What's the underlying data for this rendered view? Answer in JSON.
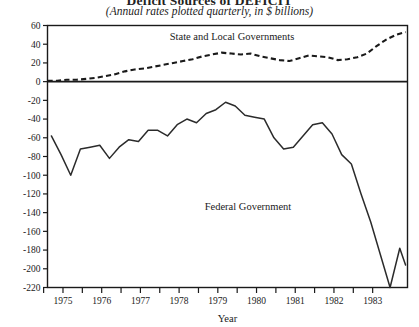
{
  "title": {
    "main": "Deficit Sources of DEFICIT",
    "sub": "(Annual rates plotted quarterly, in $ billions)"
  },
  "axes": {
    "x_title": "Year",
    "y_title": ""
  },
  "labels": {
    "state_local": "State and Local Governments",
    "federal": "Federal Government"
  },
  "chart_data": {
    "type": "line",
    "title": "Deficit Sources of DEFICIT",
    "subtitle": "(Annual rates plotted quarterly, in $ billions)",
    "xlabel": "Year",
    "ylabel": "",
    "xlim": [
      1974.6,
      1983.9
    ],
    "ylim": [
      -220,
      60
    ],
    "yticks": [
      60,
      40,
      20,
      0,
      -20,
      -40,
      -60,
      -80,
      -100,
      -120,
      -140,
      -160,
      -180,
      -200,
      -220
    ],
    "ytick_labels": [
      "60",
      "40",
      "20",
      "0",
      "-20",
      "-40",
      "-60",
      "-80",
      "-100",
      "-120",
      "-140",
      "-160",
      "-180",
      "-200",
      "-220"
    ],
    "xticks": [
      1975,
      1976,
      1977,
      1978,
      1979,
      1980,
      1981,
      1982,
      1983
    ],
    "xtick_labels": [
      "1975",
      "1976",
      "1977",
      "1978",
      "1979",
      "1980",
      "1981",
      "1982",
      "1983"
    ],
    "minor_xticks_per_interval": 3,
    "grid": false,
    "legend": "inline-annotations",
    "zero_line": 0,
    "series": [
      {
        "name": "State and Local Governments",
        "style": "dashed",
        "x": [
          1974.6,
          1974.85,
          1975.1,
          1975.35,
          1975.6,
          1975.85,
          1976.1,
          1976.35,
          1976.6,
          1976.85,
          1977.1,
          1977.35,
          1977.6,
          1977.85,
          1978.1,
          1978.35,
          1978.6,
          1978.85,
          1979.1,
          1979.35,
          1979.6,
          1979.85,
          1980.1,
          1980.35,
          1980.6,
          1980.85,
          1981.1,
          1981.35,
          1981.6,
          1981.85,
          1982.1,
          1982.35,
          1982.6,
          1982.85,
          1983.1,
          1983.35,
          1983.6,
          1983.85
        ],
        "values": [
          1,
          1,
          2,
          2,
          3,
          4,
          6,
          8,
          11,
          13,
          14,
          16,
          18,
          20,
          22,
          24,
          27,
          29,
          31,
          30,
          29,
          30,
          27,
          25,
          23,
          22,
          25,
          28,
          27,
          26,
          23,
          24,
          26,
          30,
          38,
          45,
          50,
          53
        ]
      },
      {
        "name": "Federal Government",
        "style": "solid",
        "x": [
          1974.7,
          1974.95,
          1975.2,
          1975.45,
          1975.7,
          1975.95,
          1976.2,
          1976.45,
          1976.7,
          1976.95,
          1977.2,
          1977.45,
          1977.7,
          1977.95,
          1978.2,
          1978.45,
          1978.7,
          1978.95,
          1979.2,
          1979.45,
          1979.7,
          1979.95,
          1980.2,
          1980.45,
          1980.7,
          1980.95,
          1981.2,
          1981.45,
          1981.7,
          1981.95,
          1982.2,
          1982.45,
          1982.7,
          1982.95,
          1983.2,
          1983.45,
          1983.7,
          1983.85
        ],
        "values": [
          -58,
          -78,
          -100,
          -72,
          -70,
          -68,
          -82,
          -70,
          -62,
          -64,
          -52,
          -52,
          -58,
          -46,
          -40,
          -44,
          -34,
          -30,
          -22,
          -26,
          -36,
          -38,
          -40,
          -60,
          -72,
          -70,
          -58,
          -46,
          -44,
          -56,
          -78,
          -88,
          -120,
          -150,
          -185,
          -220,
          -178,
          -196
        ]
      }
    ]
  }
}
